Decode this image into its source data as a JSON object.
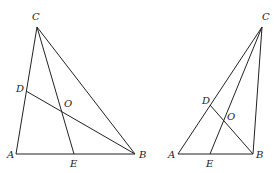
{
  "figures": [
    {
      "name": "left-triangle",
      "points": {
        "A": {
          "label": "A",
          "x": 16,
          "y": 154,
          "lx": 7,
          "ly": 158
        },
        "B": {
          "label": "B",
          "x": 135,
          "y": 154,
          "lx": 139,
          "ly": 158
        },
        "C": {
          "label": "C",
          "x": 37,
          "y": 27,
          "lx": 32,
          "ly": 20
        },
        "D": {
          "label": "D",
          "x": 26,
          "y": 91,
          "lx": 16,
          "ly": 92
        },
        "E": {
          "label": "E",
          "x": 74,
          "y": 154,
          "lx": 70,
          "ly": 167
        },
        "O": {
          "label": "O",
          "x": 62,
          "y": 111,
          "lx": 64,
          "ly": 107
        }
      },
      "segments": [
        [
          "A",
          "B"
        ],
        [
          "A",
          "C"
        ],
        [
          "B",
          "C"
        ],
        [
          "C",
          "E"
        ],
        [
          "B",
          "D"
        ]
      ]
    },
    {
      "name": "right-triangle",
      "points": {
        "A": {
          "label": "A",
          "x": 178,
          "y": 154,
          "lx": 168,
          "ly": 158
        },
        "B": {
          "label": "B",
          "x": 253,
          "y": 154,
          "lx": 256,
          "ly": 158
        },
        "C": {
          "label": "C",
          "x": 262,
          "y": 27,
          "lx": 262,
          "ly": 20
        },
        "D": {
          "label": "D",
          "x": 210,
          "y": 105,
          "lx": 202,
          "ly": 104
        },
        "E": {
          "label": "E",
          "x": 210,
          "y": 154,
          "lx": 206,
          "ly": 167
        },
        "O": {
          "label": "O",
          "x": 224,
          "y": 121,
          "lx": 227,
          "ly": 120
        }
      },
      "segments": [
        [
          "A",
          "B"
        ],
        [
          "A",
          "C"
        ],
        [
          "B",
          "C"
        ],
        [
          "C",
          "E"
        ],
        [
          "B",
          "D"
        ]
      ]
    }
  ],
  "labels": {
    "left": {
      "A": "A",
      "B": "B",
      "C": "C",
      "D": "D",
      "E": "E",
      "O": "O"
    },
    "right": {
      "A": "A",
      "B": "B",
      "C": "C",
      "D": "D",
      "E": "E",
      "O": "O"
    }
  }
}
